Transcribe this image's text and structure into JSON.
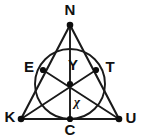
{
  "figure": {
    "stroke_color": "#1a1a1a",
    "label_color": "#111111",
    "background_color": "#ffffff",
    "vertices": [
      {
        "id": "N",
        "label": "N",
        "x": 70,
        "y": 25,
        "label_x": 70,
        "label_y": 11,
        "anchor": "middle"
      },
      {
        "id": "K",
        "label": "K",
        "x": 21,
        "y": 119,
        "label_x": 10,
        "label_y": 118,
        "anchor": "middle"
      },
      {
        "id": "U",
        "label": "U",
        "x": 119,
        "y": 119,
        "label_x": 131,
        "label_y": 119,
        "anchor": "middle"
      }
    ],
    "touch_points": [
      {
        "id": "E",
        "label": "E",
        "x": 43,
        "y": 70,
        "label_x": 29,
        "label_y": 68,
        "anchor": "middle"
      },
      {
        "id": "T",
        "label": "T",
        "x": 96,
        "y": 70,
        "label_x": 110,
        "label_y": 68,
        "anchor": "middle"
      },
      {
        "id": "C",
        "label": "C",
        "x": 70,
        "y": 119,
        "label_x": 70,
        "label_y": 131,
        "anchor": "middle"
      }
    ],
    "incenter": {
      "id": "Y-point",
      "x": 70,
      "y": 84
    },
    "incircle": {
      "cx": 70,
      "cy": 84,
      "r": 35
    },
    "edges": [
      {
        "id": "edge-N-K",
        "from": "N",
        "to": "K"
      },
      {
        "id": "edge-N-U",
        "from": "N",
        "to": "U"
      },
      {
        "id": "edge-K-U",
        "from": "K",
        "to": "U"
      }
    ],
    "cevians": [
      {
        "id": "cevian-N-C",
        "from": "N",
        "to": "C"
      },
      {
        "id": "cevian-K-T",
        "from": "K",
        "to": "T"
      },
      {
        "id": "cevian-U-E",
        "from": "U",
        "to": "E"
      }
    ],
    "interior_labels": [
      {
        "id": "Y",
        "label": "Y",
        "x": 73,
        "y": 66
      },
      {
        "id": "x",
        "label": "χ",
        "x": 77,
        "y": 103
      }
    ]
  }
}
